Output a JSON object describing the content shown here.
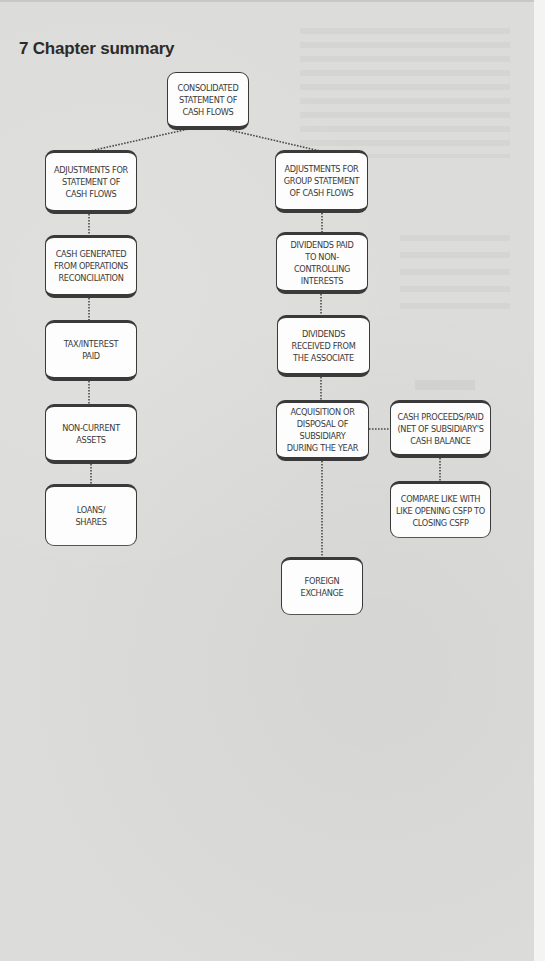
{
  "section": {
    "title": "7 Chapter summary"
  },
  "diagram": {
    "root": {
      "id": "consolidated",
      "label": "CONSOLIDATED\nSTATEMENT OF\nCASH FLOWS"
    },
    "left_branch": [
      {
        "id": "adj-cash-flows",
        "label": "ADJUSTMENTS FOR\nSTATEMENT OF\nCASH FLOWS"
      },
      {
        "id": "cash-generated",
        "label": "CASH GENERATED\nFROM OPERATIONS\nRECONCILIATION"
      },
      {
        "id": "tax-interest",
        "label": "TAX/INTEREST\nPAID"
      },
      {
        "id": "non-current",
        "label": "NON-CURRENT\nASSETS"
      },
      {
        "id": "loans-shares",
        "label": "LOANS/\nSHARES"
      }
    ],
    "right_branch": [
      {
        "id": "adj-group",
        "label": "ADJUSTMENTS FOR\nGROUP STATEMENT\nOF CASH FLOWS"
      },
      {
        "id": "dividends-nci",
        "label": "DIVIDENDS PAID\nTO NON-\nCONTROLLING\nINTERESTS"
      },
      {
        "id": "dividends-assoc",
        "label": "DIVIDENDS\nRECEIVED FROM\nTHE ASSOCIATE"
      },
      {
        "id": "acquisition",
        "label": "ACQUISITION OR\nDISPOSAL OF\nSUBSIDIARY\nDURING THE YEAR"
      },
      {
        "id": "foreign-exchange",
        "label": "FOREIGN\nEXCHANGE"
      }
    ],
    "side_branch": [
      {
        "id": "cash-proceeds",
        "label": "CASH PROCEEDS/PAID\n(NET OF SUBSIDIARY'S\nCASH BALANCE"
      },
      {
        "id": "compare",
        "label": "COMPARE LIKE WITH\nLIKE OPENING CSFP TO\nCLOSING CSFP"
      }
    ],
    "edges": [
      [
        "consolidated",
        "adj-cash-flows"
      ],
      [
        "consolidated",
        "adj-group"
      ],
      [
        "adj-cash-flows",
        "cash-generated"
      ],
      [
        "cash-generated",
        "tax-interest"
      ],
      [
        "tax-interest",
        "non-current"
      ],
      [
        "non-current",
        "loans-shares"
      ],
      [
        "adj-group",
        "dividends-nci"
      ],
      [
        "dividends-nci",
        "dividends-assoc"
      ],
      [
        "dividends-assoc",
        "acquisition"
      ],
      [
        "acquisition",
        "foreign-exchange"
      ],
      [
        "acquisition",
        "cash-proceeds"
      ],
      [
        "cash-proceeds",
        "compare"
      ]
    ]
  }
}
